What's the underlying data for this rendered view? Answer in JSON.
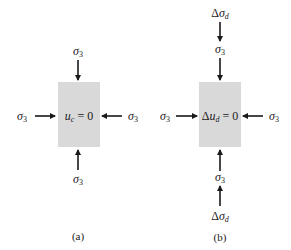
{
  "panels": [
    {
      "id": "a",
      "caption": "(a)",
      "specimen": {
        "symbol": "u",
        "subscript": "c",
        "equals": "= 0",
        "fill": "#d9d9d9"
      },
      "stresses": {
        "top": {
          "symbol": "σ",
          "subscript": "3"
        },
        "bottom": {
          "symbol": "σ",
          "subscript": "3"
        },
        "left": {
          "symbol": "σ",
          "subscript": "3"
        },
        "right": {
          "symbol": "σ",
          "subscript": "3"
        }
      }
    },
    {
      "id": "b",
      "caption": "(b)",
      "specimen": {
        "prefix": "Δ",
        "symbol": "u",
        "subscript": "d",
        "equals": "= 0",
        "fill": "#d9d9d9"
      },
      "stresses": {
        "top_outer": {
          "prefix": "Δ",
          "symbol": "σ",
          "subscript": "d"
        },
        "top": {
          "symbol": "σ",
          "subscript": "3"
        },
        "bottom": {
          "symbol": "σ",
          "subscript": "3"
        },
        "bottom_outer": {
          "prefix": "Δ",
          "symbol": "σ",
          "subscript": "d"
        },
        "left": {
          "symbol": "σ",
          "subscript": "3"
        },
        "right": {
          "symbol": "σ",
          "subscript": "3"
        }
      }
    }
  ],
  "colors": {
    "arrow": "#1a1a1a",
    "specimen": "#d9d9d9"
  }
}
